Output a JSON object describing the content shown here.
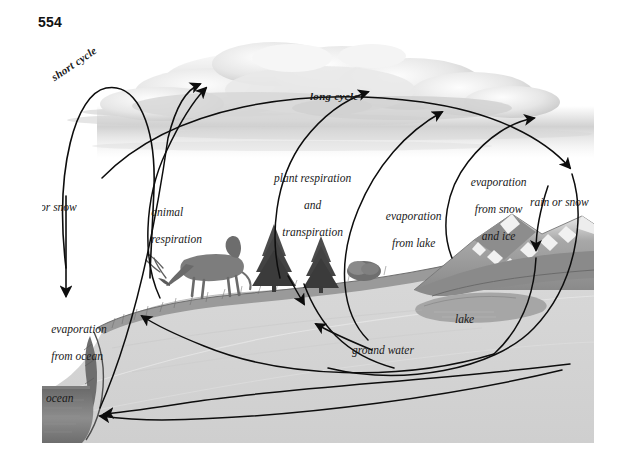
{
  "page": {
    "folio": "554",
    "background": "#ffffff"
  },
  "figure": {
    "title_semantic": "water-cycle-diagram",
    "palette": {
      "ink": "#111111",
      "sky_haze": "#d9d9d9",
      "cloud_light": "#f2f2f2",
      "cloud_mid": "#d2d2d2",
      "cloud_dark": "#b4b4b4",
      "ground_light": "#d6d6d6",
      "ground_mid": "#c6c6c6",
      "grass": "#8f8f8f",
      "rock_dark": "#6e6e6e",
      "snow": "#f4f4f4",
      "mountain": "#9a9a9a",
      "mountain_dark": "#7a7a7a",
      "water_dark": "#5c5c5c",
      "lake": "#a9a9a9"
    },
    "labels": [
      {
        "id": "short-cycle",
        "text": "short cycle",
        "style": "bold-italic-curved"
      },
      {
        "id": "long-cycle",
        "text": "long cycle",
        "style": "bold-italic"
      },
      {
        "id": "rain-or-snow-left",
        "text": "rain or snow",
        "style": "italic"
      },
      {
        "id": "animal-respiration",
        "line1": "animal",
        "line2": "respiration",
        "style": "italic"
      },
      {
        "id": "plant-respiration",
        "line1": "plant respiration",
        "line2": "and",
        "line3": "transpiration",
        "style": "italic-centered"
      },
      {
        "id": "evaporation-from-lake",
        "line1": "evaporation",
        "line2": "from lake",
        "style": "italic"
      },
      {
        "id": "evaporation-from-snow-and-ice",
        "line1": "evaporation",
        "line2": "from snow",
        "line3": "and ice",
        "style": "italic-centered"
      },
      {
        "id": "rain-or-snow-right",
        "text": "rain or snow",
        "style": "italic"
      },
      {
        "id": "lake",
        "text": "lake",
        "style": "italic"
      },
      {
        "id": "evaporation-from-ocean",
        "line1": "evaporation",
        "line2": "from ocean",
        "style": "italic"
      },
      {
        "id": "ocean",
        "text": "ocean",
        "style": "italic"
      },
      {
        "id": "ground-water",
        "text": "ground water",
        "style": "italic"
      }
    ],
    "scene_elements": [
      "cumulus-cloud-bank",
      "horizon-haze",
      "grazing-elk",
      "conifer-tree-left",
      "conifer-tree-right",
      "shrub",
      "snow-capped-mountain-range",
      "mountain-lake",
      "grass-covered-bluff",
      "soil-cross-section",
      "ocean-wedge"
    ],
    "flow_arrows": [
      "short-cycle-loop-ocean-to-sky",
      "rain-or-snow-down-to-ocean",
      "evaporation-from-ocean-up",
      "animal-respiration-up",
      "plant-respiration-and-transpiration-up",
      "long-cycle-sky-arc",
      "evaporation-from-lake-up",
      "evaporation-from-snow-and-ice-up",
      "rain-or-snow-down-to-mountain",
      "ground-water-flow-to-ocean",
      "ground-water-return-arc"
    ]
  }
}
